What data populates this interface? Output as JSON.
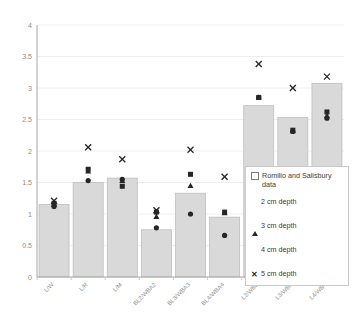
{
  "chart_data": {
    "type": "bar",
    "title": "",
    "xlabel": "",
    "ylabel": "",
    "ylim": [
      0,
      4
    ],
    "yticks": [
      "0",
      "0.5",
      "1",
      "1.5",
      "2",
      "2.5",
      "3",
      "3.5",
      "4"
    ],
    "grid": true,
    "legend_position": "inside-right",
    "categories": [
      "L/W",
      "L/R",
      "L/M",
      "BL2/WBA2",
      "BL3/WBA3",
      "BL4/WBA4",
      "L2/WB2",
      "L3/WB3",
      "L4/WB4"
    ],
    "bar_series_name": "Romilio and Salisbury data",
    "values": [
      1.15,
      1.5,
      1.57,
      0.75,
      1.33,
      0.95,
      2.72,
      2.53,
      3.07
    ],
    "series": [
      {
        "name": "Romilio and Salisbury data",
        "marker": "bar",
        "values": [
          1.15,
          1.5,
          1.57,
          0.75,
          1.33,
          0.95,
          2.72,
          2.53,
          3.07
        ]
      },
      {
        "name": "2 cm depth",
        "marker": "circle",
        "values": [
          1.12,
          1.53,
          1.55,
          0.78,
          1.0,
          0.66,
          2.85,
          2.31,
          2.52
        ]
      },
      {
        "name": "3 cm depth",
        "marker": "triangle",
        "values": [
          1.15,
          1.68,
          1.53,
          0.96,
          1.45,
          1.02,
          2.85,
          2.32,
          2.56
        ]
      },
      {
        "name": "4 cm depth",
        "marker": "square",
        "values": [
          1.17,
          1.71,
          1.44,
          1.03,
          1.63,
          1.03,
          2.85,
          2.33,
          2.62
        ]
      },
      {
        "name": "5 cm depth",
        "marker": "x",
        "values": [
          1.21,
          2.06,
          1.87,
          1.06,
          2.02,
          1.59,
          3.38,
          3.0,
          3.18
        ]
      }
    ]
  },
  "legend": {
    "title": "Romilio and Salisbury data",
    "items": [
      {
        "label": "2 cm depth",
        "marker": "circle"
      },
      {
        "label": "3 cm depth",
        "marker": "triangle"
      },
      {
        "label": "4 cm depth",
        "marker": "square"
      },
      {
        "label": "5 cm depth",
        "marker": "x"
      }
    ]
  },
  "colors": {
    "bar_fill": "#d9d9d9",
    "bar_stroke": "#bfbfbf",
    "marker": "#262626",
    "axis": "#a6a6a6",
    "grid": "#eeeeee",
    "tick_text": "#8c8c8c"
  }
}
